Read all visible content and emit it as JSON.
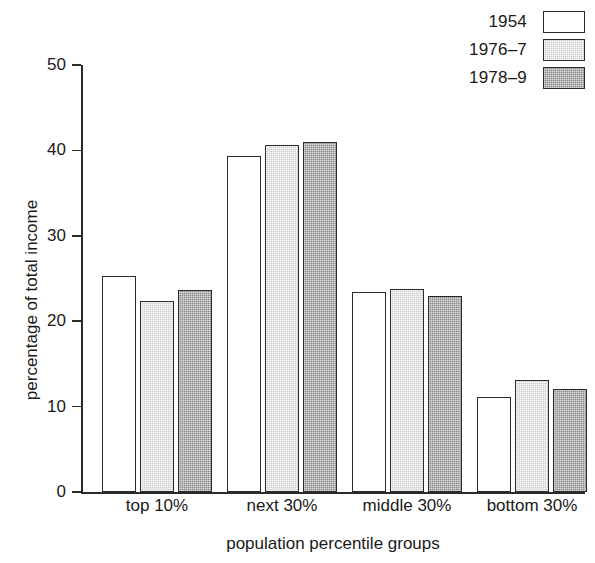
{
  "chart_data": {
    "type": "bar",
    "title": "",
    "xlabel": "population percentile groups",
    "ylabel": "percentage of total income",
    "categories": [
      "top 10%",
      "next 30%",
      "middle 30%",
      "bottom 30%"
    ],
    "series": [
      {
        "name": "1954",
        "values": [
          25.3,
          39.3,
          23.4,
          11.1
        ],
        "color": "#ffffff",
        "swatch": "fill-white"
      },
      {
        "name": "1976-7",
        "values": [
          22.4,
          40.6,
          23.8,
          13.1
        ],
        "color": "#cdcdcd",
        "swatch": "fill-light"
      },
      {
        "name": "1978-9",
        "values": [
          23.7,
          41.0,
          23.0,
          12.1
        ],
        "color": "#8c8c8c",
        "swatch": "fill-dark"
      }
    ],
    "ylim": [
      0,
      50
    ],
    "yticks": [
      0,
      10,
      20,
      30,
      40,
      50
    ],
    "ytick_labels": [
      "0",
      "10",
      "20",
      "30",
      "40",
      "50"
    ],
    "grid": false,
    "legend_position": "top-right",
    "legend_entries": [
      "1954",
      "1976–7",
      "1978–9"
    ]
  },
  "axis": {
    "line_color": "#2b2b2b"
  }
}
